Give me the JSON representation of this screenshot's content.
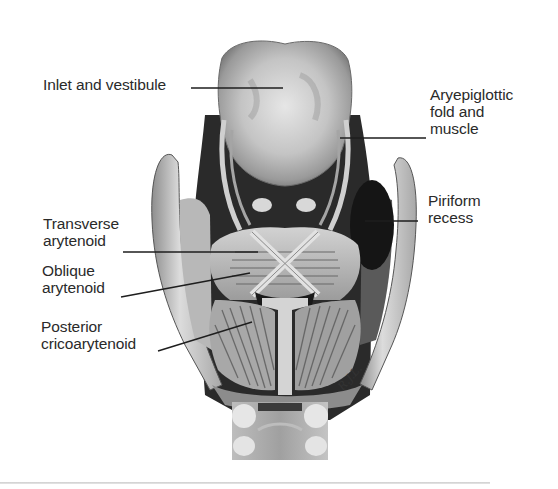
{
  "figure": {
    "labels": [
      {
        "id": "inlet",
        "text": "Inlet and vestibule"
      },
      {
        "id": "aryepiglottic",
        "text": "Aryepiglottic\nfold and\nmuscle"
      },
      {
        "id": "piriform",
        "text": "Piriform\nrecess"
      },
      {
        "id": "transverse",
        "text": "Transverse\narytenoid"
      },
      {
        "id": "oblique",
        "text": "Oblique\narytenoid"
      },
      {
        "id": "posterior",
        "text": "Posterior\ncricoarytenoid"
      }
    ],
    "signature": "R.J.L.",
    "colors": {
      "ink": "#2a2a2a",
      "dark": "#1e1e1e",
      "mid": "#7a7a7a",
      "light": "#d8d8d8",
      "rule": "#d0d0d0"
    }
  }
}
